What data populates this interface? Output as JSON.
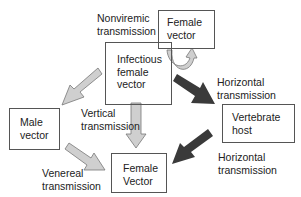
{
  "nodes": {
    "infectious": {
      "label": "Infectious\nfemale\nvector"
    },
    "female_top": {
      "label": "Female\nvector"
    },
    "male": {
      "label": "Male\nvector"
    },
    "vertebrate": {
      "label": "Vertebrate\nhost"
    },
    "female_bottom": {
      "label": "Female\nVector"
    }
  },
  "edges": {
    "nonviremic": {
      "label": "Nonviremic\ntransmission"
    },
    "vertical": {
      "label": "Vertical\ntransmission"
    },
    "horizontal_out": {
      "label": "Horizontal\ntransmission"
    },
    "horizontal_in": {
      "label": "Horizontal\ntransmission"
    },
    "venereal": {
      "label": "Venereal\ntransmission"
    }
  },
  "colors": {
    "light_arrow": "#cfcfcf",
    "dark_arrow": "#3a3a3a",
    "border": "#555555"
  }
}
